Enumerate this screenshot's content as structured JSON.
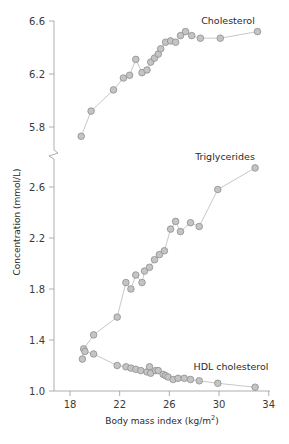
{
  "chart_data": {
    "type": "line",
    "title": "",
    "xlabel": "Body mass index (kg/m²)",
    "xlabel_main": "Body mass index (kg/m",
    "xlabel_sup": "2",
    "xlabel_tail": ")",
    "ylabel": "Concentration (mmol/L)",
    "xlim": [
      17,
      34
    ],
    "x_ticks": [
      18,
      22,
      26,
      30,
      34
    ],
    "x_tick_labels": [
      "18",
      "22",
      "26",
      "30",
      "34"
    ],
    "y_axis_broken": true,
    "y_upper_range": [
      5.6,
      6.6
    ],
    "y_upper_ticks": [
      5.8,
      6.2,
      6.6
    ],
    "y_upper_tick_labels": [
      "5.8",
      "6.2",
      "6.6"
    ],
    "y_lower_range": [
      1.0,
      2.7
    ],
    "y_lower_ticks": [
      1.0,
      1.4,
      1.8,
      2.2,
      2.6
    ],
    "y_lower_tick_labels": [
      "1.0",
      "1.4",
      "1.8",
      "2.2",
      "2.6"
    ],
    "grid": false,
    "legend": "inline labels next to series",
    "series": [
      {
        "name": "Cholesterol",
        "panel": "upper",
        "x": [
          18.9,
          19.7,
          21.5,
          22.3,
          22.8,
          23.3,
          23.8,
          24.2,
          24.5,
          24.8,
          25.1,
          25.3,
          25.7,
          26.1,
          26.5,
          26.9,
          27.3,
          27.8,
          28.5,
          30.1,
          33.1
        ],
        "y": [
          5.73,
          5.92,
          6.08,
          6.17,
          6.19,
          6.31,
          6.21,
          6.23,
          6.29,
          6.32,
          6.35,
          6.39,
          6.44,
          6.45,
          6.44,
          6.49,
          6.52,
          6.49,
          6.47,
          6.47,
          6.52
        ]
      },
      {
        "name": "Triglycerides",
        "panel": "lower",
        "x": [
          19.0,
          19.1,
          19.9,
          21.8,
          22.5,
          22.9,
          23.3,
          23.8,
          24.0,
          24.4,
          24.8,
          25.2,
          25.6,
          26.1,
          26.5,
          26.9,
          27.7,
          28.4,
          29.9,
          32.9
        ],
        "y": [
          1.25,
          1.33,
          1.44,
          1.58,
          1.85,
          1.8,
          1.91,
          1.85,
          1.94,
          1.97,
          2.03,
          2.07,
          2.1,
          2.27,
          2.33,
          2.25,
          2.32,
          2.29,
          2.58,
          2.75
        ]
      },
      {
        "name": "HDL cholesterol",
        "panel": "lower",
        "x": [
          19.2,
          19.9,
          21.8,
          22.5,
          22.9,
          23.3,
          23.7,
          24.2,
          24.4,
          24.5,
          24.9,
          25.1,
          25.5,
          25.7,
          25.9,
          26.3,
          26.7,
          27.2,
          27.7,
          28.4,
          29.9,
          32.9
        ],
        "y": [
          1.31,
          1.29,
          1.2,
          1.19,
          1.18,
          1.17,
          1.16,
          1.15,
          1.19,
          1.14,
          1.16,
          1.16,
          1.13,
          1.12,
          1.11,
          1.09,
          1.1,
          1.1,
          1.09,
          1.08,
          1.06,
          1.03
        ]
      }
    ]
  },
  "labels": {
    "cholesterol": "Cholesterol",
    "triglycerides": "Triglycerides",
    "hdl": "HDL cholesterol"
  },
  "colors": {
    "marker_fill": "#c4c4c4",
    "marker_stroke": "#8e8e8e",
    "line": "#c8c8c8",
    "axis": "#9a9a9a",
    "text": "#2a2a2a"
  }
}
